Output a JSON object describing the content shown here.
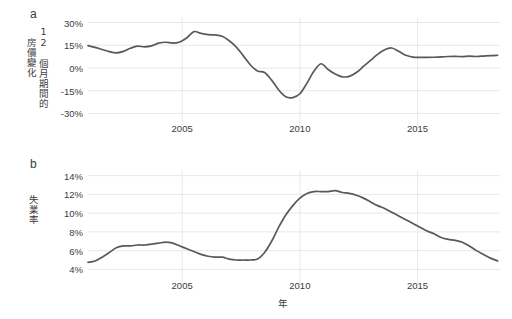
{
  "figure": {
    "background_color": "#ffffff",
    "line_color": "#595959",
    "grid_color": "#e8e8e8",
    "text_color": "#3c3c3c",
    "xlabel": "年"
  },
  "panels": [
    {
      "letter": "a",
      "ylabel_col1": "房價變化",
      "ylabel_col2": "12 個月期間的",
      "ytick_labels": [
        "30%",
        "15%",
        "0%",
        "-15%",
        "-30%"
      ],
      "xtick_labels": [
        "2005",
        "2010",
        "2015"
      ]
    },
    {
      "letter": "b",
      "ylabel": "失業率",
      "ytick_labels": [
        "14%",
        "12%",
        "10%",
        "8%",
        "6%",
        "4%"
      ],
      "xtick_labels": [
        "2005",
        "2010",
        "2015"
      ]
    }
  ],
  "chart_data": [
    {
      "type": "line",
      "title": "",
      "panel": "a",
      "xlabel": "年",
      "ylabel": "12 個月期間的房價變化",
      "xlim": [
        2001.0,
        2018.5
      ],
      "ylim": [
        -33,
        33
      ],
      "yticks": [
        30,
        15,
        0,
        -15,
        -30
      ],
      "ytick_labels": [
        "30%",
        "15%",
        "0%",
        "-15%",
        "-30%"
      ],
      "xticks": [
        2005,
        2010,
        2015
      ],
      "xtick_labels": [
        "2005",
        "2010",
        "2015"
      ],
      "grid": true,
      "legend": null,
      "series": [
        {
          "name": "12-month house price change",
          "color": "#595959",
          "x": [
            2001.0,
            2001.3,
            2001.6,
            2001.9,
            2002.2,
            2002.5,
            2002.8,
            2003.1,
            2003.4,
            2003.7,
            2004.0,
            2004.3,
            2004.6,
            2004.9,
            2005.2,
            2005.5,
            2005.8,
            2006.1,
            2006.4,
            2006.7,
            2007.0,
            2007.3,
            2007.6,
            2007.9,
            2008.2,
            2008.5,
            2008.8,
            2009.1,
            2009.4,
            2009.7,
            2010.0,
            2010.3,
            2010.6,
            2010.9,
            2011.2,
            2011.5,
            2011.8,
            2012.1,
            2012.4,
            2012.7,
            2013.0,
            2013.3,
            2013.6,
            2013.9,
            2014.2,
            2014.5,
            2014.8,
            2015.1,
            2015.4,
            2015.7,
            2016.0,
            2016.3,
            2016.6,
            2016.9,
            2017.2,
            2017.5,
            2017.8,
            2018.1,
            2018.4
          ],
          "y": [
            14.8,
            13.6,
            12.2,
            10.8,
            10.0,
            11.0,
            13.0,
            14.4,
            14.0,
            14.6,
            16.4,
            17.0,
            16.4,
            17.2,
            20.0,
            24.0,
            22.8,
            22.0,
            21.8,
            21.0,
            18.0,
            13.8,
            8.0,
            2.0,
            -2.0,
            -3.0,
            -8.0,
            -14.5,
            -19.0,
            -19.5,
            -17.0,
            -10.0,
            -2.0,
            2.8,
            -1.0,
            -4.0,
            -5.8,
            -5.5,
            -3.0,
            1.0,
            5.0,
            9.0,
            12.0,
            13.2,
            11.0,
            8.4,
            7.2,
            7.0,
            7.0,
            7.1,
            7.3,
            7.6,
            7.7,
            7.5,
            7.8,
            7.6,
            7.9,
            8.2,
            8.4
          ]
        }
      ]
    },
    {
      "type": "line",
      "title": "",
      "panel": "b",
      "xlabel": "年",
      "ylabel": "失業率",
      "xlim": [
        2001.0,
        2018.5
      ],
      "ylim": [
        3.4,
        14.6
      ],
      "yticks": [
        14,
        12,
        10,
        8,
        6,
        4
      ],
      "ytick_labels": [
        "14%",
        "12%",
        "10%",
        "8%",
        "6%",
        "4%"
      ],
      "xticks": [
        2005,
        2010,
        2015
      ],
      "xtick_labels": [
        "2005",
        "2010",
        "2015"
      ],
      "grid": true,
      "legend": null,
      "series": [
        {
          "name": "Unemployment rate",
          "color": "#595959",
          "x": [
            2001.0,
            2001.3,
            2001.6,
            2001.9,
            2002.2,
            2002.5,
            2002.8,
            2003.1,
            2003.4,
            2003.7,
            2004.0,
            2004.3,
            2004.6,
            2004.9,
            2005.2,
            2005.5,
            2005.8,
            2006.1,
            2006.4,
            2006.7,
            2007.0,
            2007.3,
            2007.6,
            2007.9,
            2008.2,
            2008.5,
            2008.8,
            2009.1,
            2009.4,
            2009.7,
            2010.0,
            2010.3,
            2010.6,
            2010.9,
            2011.2,
            2011.5,
            2011.8,
            2012.1,
            2012.4,
            2012.7,
            2013.0,
            2013.3,
            2013.6,
            2013.9,
            2014.2,
            2014.5,
            2014.8,
            2015.1,
            2015.4,
            2015.7,
            2016.0,
            2016.3,
            2016.6,
            2016.9,
            2017.2,
            2017.5,
            2017.8,
            2018.1,
            2018.4
          ],
          "y": [
            4.75,
            4.9,
            5.3,
            5.8,
            6.3,
            6.5,
            6.5,
            6.6,
            6.6,
            6.7,
            6.8,
            6.9,
            6.8,
            6.5,
            6.2,
            5.9,
            5.6,
            5.4,
            5.3,
            5.3,
            5.1,
            5.0,
            5.0,
            5.0,
            5.1,
            5.8,
            7.0,
            8.5,
            9.8,
            10.8,
            11.6,
            12.1,
            12.3,
            12.3,
            12.3,
            12.4,
            12.2,
            12.1,
            11.9,
            11.6,
            11.2,
            10.8,
            10.5,
            10.1,
            9.7,
            9.3,
            8.9,
            8.5,
            8.1,
            7.8,
            7.4,
            7.2,
            7.1,
            6.9,
            6.5,
            6.0,
            5.6,
            5.2,
            4.9
          ]
        }
      ]
    }
  ]
}
